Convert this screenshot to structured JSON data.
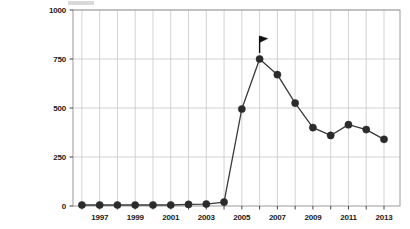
{
  "chart_data": {
    "type": "line",
    "title": "",
    "subtitle": "",
    "xlabel": "",
    "ylabel": "",
    "x": [
      1996,
      1997,
      1998,
      1999,
      2000,
      2001,
      2002,
      2003,
      2004,
      2005,
      2006,
      2007,
      2008,
      2009,
      2010,
      2011,
      2012,
      2013
    ],
    "values": [
      5,
      5,
      5,
      5,
      5,
      5,
      8,
      10,
      20,
      495,
      750,
      670,
      525,
      400,
      360,
      415,
      390,
      340
    ],
    "series": [
      {
        "name": "series-1",
        "values": [
          5,
          5,
          5,
          5,
          5,
          5,
          8,
          10,
          20,
          495,
          750,
          670,
          525,
          400,
          360,
          415,
          390,
          340
        ]
      }
    ],
    "xlim": [
      1995.5,
      2013.9
    ],
    "ylim": [
      0,
      1000
    ],
    "ytick_values": [
      0,
      250,
      500,
      750,
      1000
    ],
    "ytick_labels": [
      "0",
      "250",
      "500",
      "750",
      "1000"
    ],
    "xtick_values": [
      1997,
      1999,
      2001,
      2003,
      2005,
      2007,
      2009,
      2011,
      2013
    ],
    "xtick_labels": [
      "1997",
      "1999",
      "2001",
      "2003",
      "2005",
      "2007",
      "2009",
      "2011",
      "2013"
    ],
    "xtick_minor_values": [
      1996,
      1998,
      2000,
      2002,
      2004,
      2006,
      2008,
      2010,
      2012
    ],
    "grid": true,
    "grid_axis": "both",
    "legend": null,
    "legend_position": "none",
    "annotations": [
      {
        "name": "flag-marker",
        "icon": "flag-icon",
        "x": 2006,
        "y": 750,
        "label": ""
      }
    ],
    "colors": {
      "line": "#3a3a3a",
      "marker": "#2b2b2b",
      "grid": "#c8c8c8",
      "frame": "#9a9a9a",
      "text": "#1a1a1a",
      "background": "#ffffff",
      "flag": "#111111"
    },
    "geometry": {
      "plot_left": 73,
      "plot_right": 400,
      "plot_top": 10,
      "plot_bottom": 206,
      "marker_radius": 3.6,
      "line_width": 1.3
    }
  }
}
